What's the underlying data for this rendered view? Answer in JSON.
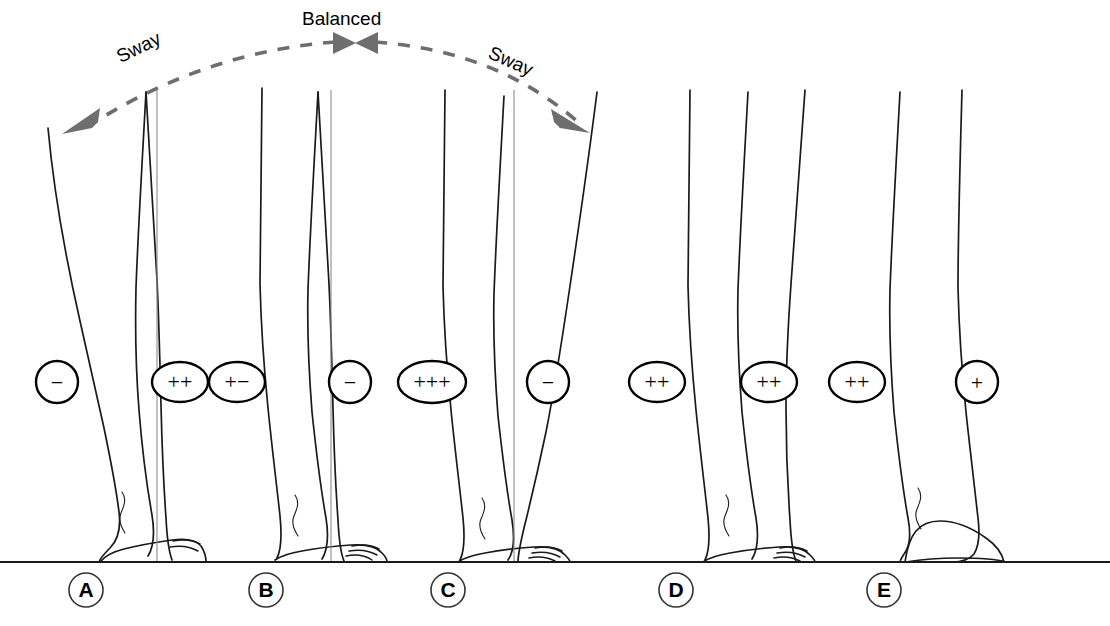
{
  "figure": {
    "background_color": "#ffffff",
    "ink_color": "#1a1a1a",
    "arc_color": "#6e6e6e",
    "plumb_color": "#8a8a8a",
    "ground_color": "#1a1a1a",
    "width": 1110,
    "height": 626
  },
  "annotations": {
    "balanced_label": "Balanced",
    "sway_left_label": "Sway",
    "sway_right_label": "Sway",
    "arc": {
      "dashed": true,
      "arrow_left_label": "Sway",
      "arrow_right_label": "Sway",
      "center_arrows": 2
    }
  },
  "ground": {
    "label": "ground-line",
    "y": 562
  },
  "panels": [
    {
      "id": "A",
      "letter": "A",
      "label_x": 86,
      "label_y": 590,
      "description": "backward sway, leg leaning posteriorly",
      "plumb_line_x": 157,
      "badges": [
        {
          "symbol": "−",
          "shape": "circle",
          "cx": 57,
          "cy": 382,
          "rx": 21,
          "ry": 21
        }
      ]
    },
    {
      "id": "B",
      "letter": "B",
      "label_x": 266,
      "label_y": 590,
      "description": "balanced upright stance",
      "plumb_line_x": 331,
      "badges": [
        {
          "symbol": "++",
          "shape": "ellipse",
          "cx": 180,
          "cy": 382,
          "rx": 28,
          "ry": 20
        },
        {
          "symbol": "+−",
          "shape": "ellipse",
          "cx": 237,
          "cy": 382,
          "rx": 28,
          "ry": 20
        }
      ]
    },
    {
      "id": "C",
      "letter": "C",
      "label_x": 448,
      "label_y": 590,
      "description": "forward sway, leg leaning anteriorly",
      "plumb_line_x": 514,
      "badges": [
        {
          "symbol": "−",
          "shape": "circle",
          "cx": 350,
          "cy": 382,
          "rx": 21,
          "ry": 21
        },
        {
          "symbol": "+++",
          "shape": "ellipse",
          "cx": 432,
          "cy": 382,
          "rx": 34,
          "ry": 21
        },
        {
          "symbol": "−",
          "shape": "circle",
          "cx": 548,
          "cy": 382,
          "rx": 21,
          "ry": 21
        }
      ]
    },
    {
      "id": "D",
      "letter": "D",
      "label_x": 676,
      "label_y": 590,
      "description": "bilateral stance, increased activity",
      "plumb_line_x": null,
      "badges": [
        {
          "symbol": "++",
          "shape": "ellipse",
          "cx": 657,
          "cy": 382,
          "rx": 28,
          "ry": 20
        },
        {
          "symbol": "++",
          "shape": "ellipse",
          "cx": 769,
          "cy": 382,
          "rx": 28,
          "ry": 20
        }
      ]
    },
    {
      "id": "E",
      "letter": "E",
      "label_x": 884,
      "label_y": 590,
      "description": "standing in high heels",
      "plumb_line_x": null,
      "badges": [
        {
          "symbol": "++",
          "shape": "ellipse",
          "cx": 857,
          "cy": 382,
          "rx": 28,
          "ry": 20
        },
        {
          "symbol": "+",
          "shape": "circle",
          "cx": 977,
          "cy": 382,
          "rx": 21,
          "ry": 21
        }
      ]
    }
  ],
  "legs": [
    {
      "name": "leg-a-front",
      "panel": "A"
    },
    {
      "name": "leg-a-back",
      "panel": "A"
    },
    {
      "name": "leg-b-front",
      "panel": "B"
    },
    {
      "name": "leg-b-back",
      "panel": "B"
    },
    {
      "name": "leg-c-front",
      "panel": "C"
    },
    {
      "name": "leg-c-back",
      "panel": "C"
    },
    {
      "name": "leg-d-front",
      "panel": "D"
    },
    {
      "name": "leg-d-back",
      "panel": "D"
    },
    {
      "name": "leg-e-front",
      "panel": "E"
    },
    {
      "name": "leg-e-back",
      "panel": "E"
    }
  ]
}
